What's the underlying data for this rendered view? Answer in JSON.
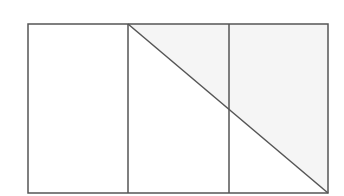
{
  "diagram": {
    "colors": {
      "stroke": "#555555",
      "shade": "#f5f5f5",
      "background": "#ffffff"
    },
    "rectangle": {
      "x": 28,
      "y": 24,
      "width": 300,
      "height": 169
    },
    "dividers_x": [
      128,
      229
    ],
    "diagonal": {
      "x1": 128,
      "y1": 24,
      "x2": 328,
      "y2": 193
    },
    "shaded_region": "triangle (128,24)-(328,24)-(328,193)"
  }
}
